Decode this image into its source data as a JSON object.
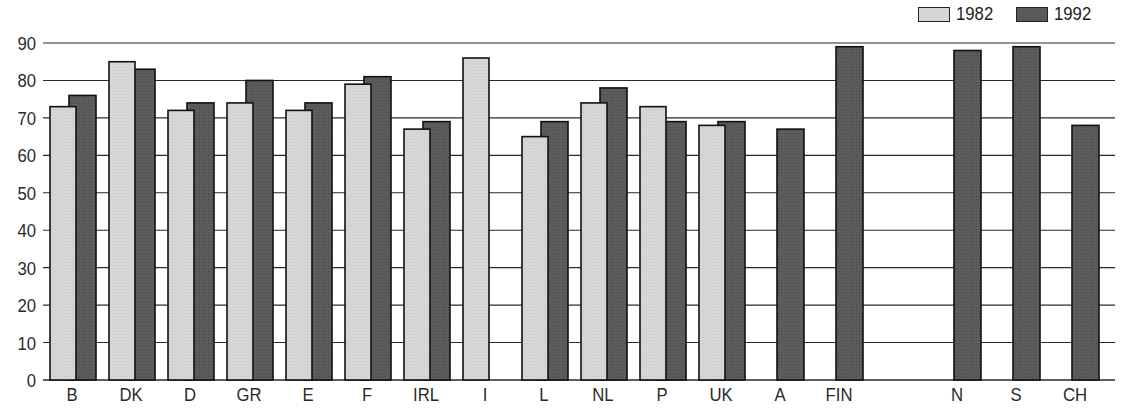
{
  "chart_data": {
    "type": "bar",
    "title": "",
    "xlabel": "",
    "ylabel": "",
    "ylim": [
      0,
      90
    ],
    "yticks": [
      0,
      10,
      20,
      30,
      40,
      50,
      60,
      70,
      80,
      90
    ],
    "grid": true,
    "legend_position": "top-right",
    "categories": [
      "B",
      "DK",
      "D",
      "GR",
      "E",
      "F",
      "IRL",
      "I",
      "L",
      "NL",
      "P",
      "UK",
      "A",
      "FIN",
      "",
      "N",
      "S",
      "CH"
    ],
    "series": [
      {
        "name": "1982",
        "color": "#d6d6d6",
        "values": [
          73,
          85,
          72,
          74,
          72,
          79,
          67,
          86,
          65,
          74,
          73,
          68,
          null,
          null,
          null,
          null,
          null,
          null
        ]
      },
      {
        "name": "1992",
        "color": "#595959",
        "values": [
          76,
          83,
          74,
          80,
          74,
          81,
          69,
          null,
          69,
          78,
          69,
          69,
          67,
          89,
          null,
          88,
          89,
          68
        ]
      }
    ]
  },
  "legend": {
    "items": [
      {
        "label": "1982",
        "color": "#d6d6d6"
      },
      {
        "label": "1992",
        "color": "#595959"
      }
    ]
  }
}
